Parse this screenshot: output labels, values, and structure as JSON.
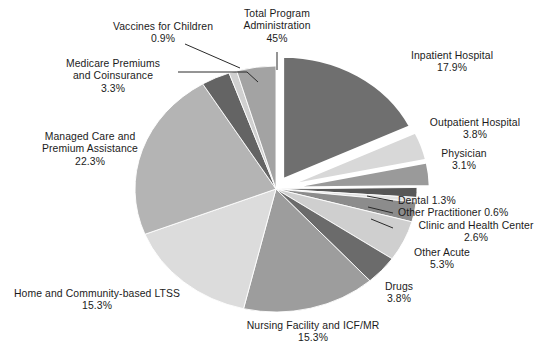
{
  "chart_data": {
    "type": "pie",
    "title": "",
    "subtitle": "",
    "xlabel": "",
    "ylabel": "",
    "legend_position": "none",
    "grid": false,
    "value_unit": "percent",
    "total": 100.0,
    "start_angle_deg": 0,
    "direction": "clockwise",
    "exploded_slices": [
      "Inpatient Hospital",
      "Outpatient Hospital",
      "Physician"
    ],
    "categories": [
      "Inpatient Hospital",
      "Outpatient Hospital",
      "Physician",
      "Dental",
      "Other Practitioner",
      "Clinic and Health Center",
      "Other Acute",
      "Drugs",
      "Nursing Facility and ICF/MR",
      "Home and Community-based LTSS",
      "Managed Care and Premium Assistance",
      "Medicare Premiums and Coinsurance",
      "Vaccines for Children",
      "Total Program Administration"
    ],
    "values": [
      17.9,
      3.8,
      3.1,
      1.3,
      0.6,
      2.6,
      5.3,
      3.8,
      15.3,
      15.3,
      22.3,
      3.3,
      0.9,
      4.5
    ],
    "colors": [
      "#6f6f6f",
      "#d8d8d8",
      "#9a9a9a",
      "#575757",
      "#e2e2e2",
      "#8c8c8c",
      "#cfcfcf",
      "#6b6b6b",
      "#9d9d9d",
      "#dcdcdc",
      "#b4b4b4",
      "#646464",
      "#d0d0d0",
      "#a3a3a3"
    ],
    "slices": [
      {
        "label": "Inpatient Hospital",
        "value": 17.9,
        "value_text": "17.9%",
        "color": "#6f6f6f"
      },
      {
        "label": "Outpatient Hospital",
        "value": 3.8,
        "value_text": "3.8%",
        "color": "#d8d8d8"
      },
      {
        "label": "Physician",
        "value": 3.1,
        "value_text": "3.1%",
        "color": "#9a9a9a"
      },
      {
        "label": "Dental",
        "value": 1.3,
        "value_text": "1.3%",
        "color": "#575757"
      },
      {
        "label": "Other Practitioner",
        "value": 0.6,
        "value_text": "0.6%",
        "color": "#e2e2e2"
      },
      {
        "label": "Clinic and Health Center",
        "value": 2.6,
        "value_text": "2.6%",
        "color": "#8c8c8c"
      },
      {
        "label": "Other Acute",
        "value": 5.3,
        "value_text": "5.3%",
        "color": "#cfcfcf"
      },
      {
        "label": "Drugs",
        "value": 3.8,
        "value_text": "3.8%",
        "color": "#6b6b6b"
      },
      {
        "label": "Nursing Facility and ICF/MR",
        "value": 15.3,
        "value_text": "15.3%",
        "color": "#9d9d9d"
      },
      {
        "label": "Home and Community-based LTSS",
        "value": 15.3,
        "value_text": "15.3%",
        "color": "#dcdcdc"
      },
      {
        "label": "Managed Care and Premium Assistance",
        "value": 22.3,
        "value_text": "22.3%",
        "color": "#b4b4b4"
      },
      {
        "label": "Medicare Premiums and Coinsurance",
        "value": 3.3,
        "value_text": "3.3%",
        "color": "#646464"
      },
      {
        "label": "Vaccines for Children",
        "value": 0.9,
        "value_text": "0.9%",
        "color": "#d0d0d0"
      },
      {
        "label": "Total Program Administration",
        "value": 4.5,
        "value_text": "45%",
        "color": "#a3a3a3"
      }
    ]
  },
  "labels": {
    "inpatient_hospital": {
      "line1": "Inpatient Hospital",
      "value": "17.9%"
    },
    "outpatient_hospital": {
      "line1": "Outpatient Hospital",
      "value": "3.8%"
    },
    "physician": {
      "line1": "Physician",
      "value": "3.1%"
    },
    "dental": {
      "line1": "Dental",
      "value": "1.3%"
    },
    "other_practitioner": {
      "line1": "Other Practitioner",
      "value": "0.6%"
    },
    "clinic": {
      "line1": "Clinic and Health Center",
      "value": "2.6%"
    },
    "other_acute": {
      "line1": "Other Acute",
      "value": "5.3%"
    },
    "drugs": {
      "line1": "Drugs",
      "value": "3.8%"
    },
    "nursing_facility": {
      "line1": "Nursing Facility and ICF/MR",
      "value": "15.3%"
    },
    "hcbs": {
      "line1": "Home and Community-based LTSS",
      "value": "15.3%"
    },
    "managed_care": {
      "line1": "Managed Care and",
      "line2": "Premium Assistance",
      "value": "22.3%"
    },
    "medicare_premiums": {
      "line1": "Medicare Premiums",
      "line2": "and Coinsurance",
      "value": "3.3%"
    },
    "vaccines": {
      "line1": "Vaccines for Children",
      "value": "0.9%"
    },
    "total_program_admin": {
      "line1": "Total Program",
      "line2": "Administration",
      "value": "45%"
    }
  },
  "style": {
    "background": "#ffffff",
    "text_color": "#1b1b1b",
    "leader_line_color": "#2a2a2a",
    "slice_edge_color": "#ffffff"
  }
}
